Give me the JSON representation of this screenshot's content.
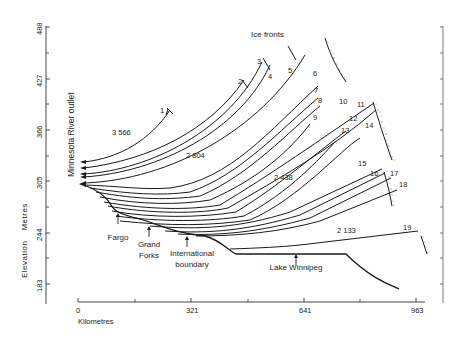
{
  "figure": {
    "title": "Ice fronts",
    "y_axis": {
      "label_word1": "Elevation",
      "label_word2": "Metres",
      "ticks": [
        {
          "label": "488",
          "y": 27
        },
        {
          "label": "427",
          "y": 79
        },
        {
          "label": "366",
          "y": 130
        },
        {
          "label": "305",
          "y": 181
        },
        {
          "label": "244",
          "y": 233
        },
        {
          "label": "183",
          "y": 284
        }
      ],
      "minor_ticks_y": [
        53,
        104,
        156,
        207,
        258
      ]
    },
    "x_axis": {
      "label": "Kilometres",
      "ticks": [
        {
          "label": "0",
          "x": 78
        },
        {
          "label": "321",
          "x": 191
        },
        {
          "label": "641",
          "x": 304
        },
        {
          "label": "963",
          "x": 416
        }
      ],
      "minor_ticks_x": [
        135,
        248,
        360
      ]
    },
    "outlet_label": "Minnesota River outlet",
    "places": [
      {
        "label": "Fargo",
        "x": 118,
        "y": 240,
        "arrow_x": 118,
        "arrow_top": 213
      },
      {
        "label": "Grand",
        "label2": "Forks",
        "x": 149,
        "y": 247,
        "arrow_x": 149,
        "arrow_top": 226
      },
      {
        "label": "International",
        "label2": "boundary",
        "x": 192,
        "y": 256,
        "arrow_x": 187,
        "arrow_top": 236
      },
      {
        "label": "Lake Winnipeg",
        "x": 296,
        "y": 270,
        "arrow_x": 296,
        "arrow_top": 254
      }
    ],
    "strandline_labels": [
      {
        "text": "3 566",
        "x": 112,
        "y": 135
      },
      {
        "text": "2 804",
        "x": 186,
        "y": 158
      },
      {
        "text": "2 438",
        "x": 274,
        "y": 180
      },
      {
        "text": "2 133",
        "x": 337,
        "y": 233
      }
    ],
    "ice_front_numbers": [
      {
        "n": "1",
        "x": 160,
        "y": 113
      },
      {
        "n": "2",
        "x": 238,
        "y": 84
      },
      {
        "n": "3",
        "x": 257,
        "y": 64
      },
      {
        "n": "4",
        "x": 268,
        "y": 79
      },
      {
        "n": "5",
        "x": 288,
        "y": 73
      },
      {
        "n": "6",
        "x": 313,
        "y": 76
      },
      {
        "n": "7",
        "x": 314,
        "y": 93
      },
      {
        "n": "8",
        "x": 318,
        "y": 103
      },
      {
        "n": "9",
        "x": 313,
        "y": 120
      },
      {
        "n": "10",
        "x": 339,
        "y": 104
      },
      {
        "n": "11",
        "x": 357,
        "y": 107
      },
      {
        "n": "12",
        "x": 349,
        "y": 121
      },
      {
        "n": "13",
        "x": 341,
        "y": 133
      },
      {
        "n": "14",
        "x": 365,
        "y": 128
      },
      {
        "n": "15",
        "x": 358,
        "y": 166
      },
      {
        "n": "16",
        "x": 370,
        "y": 176
      },
      {
        "n": "17",
        "x": 390,
        "y": 176
      },
      {
        "n": "18",
        "x": 399,
        "y": 187
      },
      {
        "n": "19",
        "x": 403,
        "y": 230
      }
    ]
  }
}
